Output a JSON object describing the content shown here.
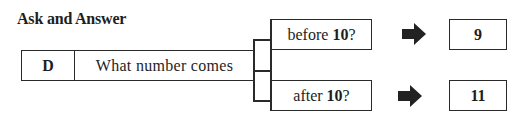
{
  "title": "Ask and Answer",
  "row": {
    "label": "D",
    "question_stem": "What number comes"
  },
  "branches": [
    {
      "prefix": "before ",
      "number": "10",
      "suffix": "?",
      "answer": "9"
    },
    {
      "prefix": "after ",
      "number": "10",
      "suffix": "?",
      "answer": "11"
    }
  ],
  "icons": {
    "arrow": "right-arrow-icon"
  },
  "colors": {
    "ink": "#2a2a2a",
    "background": "#ffffff"
  }
}
